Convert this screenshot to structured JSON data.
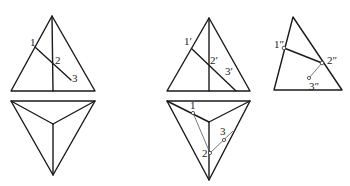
{
  "diagram": {
    "stroke_color": "#1a1a1a",
    "figures": [
      {
        "id": "given",
        "front_view": {
          "labels": [
            {
              "text": "1",
              "x": 30,
              "y": 46
            },
            {
              "text": "2",
              "x": 55,
              "y": 64
            },
            {
              "text": "3",
              "x": 72,
              "y": 82
            }
          ]
        },
        "top_view": {
          "labels": []
        }
      },
      {
        "id": "solution",
        "front_view": {
          "labels": [
            {
              "text": "1′",
              "x": 184,
              "y": 45
            },
            {
              "text": "2′",
              "x": 210,
              "y": 64
            },
            {
              "text": "3′",
              "x": 225,
              "y": 75
            }
          ]
        },
        "top_view": {
          "labels": [
            {
              "text": "1",
              "x": 190,
              "y": 109
            },
            {
              "text": "2",
              "x": 202,
              "y": 157
            },
            {
              "text": "3",
              "x": 220,
              "y": 135
            }
          ]
        }
      },
      {
        "id": "side_view",
        "side_view": {
          "labels": [
            {
              "text": "1″",
              "x": 274,
              "y": 48
            },
            {
              "text": "2″",
              "x": 327,
              "y": 64
            },
            {
              "text": "3″",
              "x": 309,
              "y": 90
            }
          ]
        }
      }
    ]
  }
}
